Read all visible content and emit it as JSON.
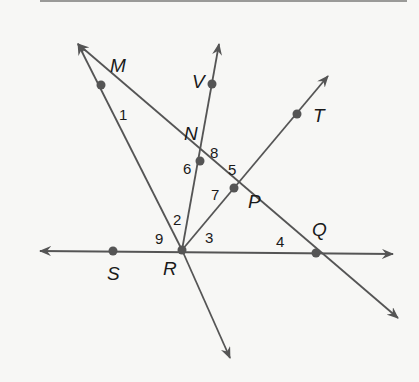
{
  "diagram": {
    "type": "geometry-lines-and-angles",
    "colors": {
      "line": "#555555",
      "point": "#555555",
      "text": "#1a1a1a",
      "background": "#f7f7f5"
    },
    "points": [
      {
        "name": "M",
        "x": 101,
        "y": 85,
        "lx": 110,
        "ly": 72
      },
      {
        "name": "V",
        "x": 212,
        "y": 84,
        "lx": 192,
        "ly": 88
      },
      {
        "name": "N",
        "x": 200,
        "y": 161,
        "lx": 184,
        "ly": 140
      },
      {
        "name": "P",
        "x": 234,
        "y": 188,
        "lx": 248,
        "ly": 208
      },
      {
        "name": "T",
        "x": 297,
        "y": 114,
        "lx": 313,
        "ly": 122
      },
      {
        "name": "R",
        "x": 182,
        "y": 250,
        "lx": 163,
        "ly": 275
      },
      {
        "name": "S",
        "x": 113,
        "y": 251,
        "lx": 107,
        "ly": 280
      },
      {
        "name": "Q",
        "x": 316,
        "y": 253,
        "lx": 312,
        "ly": 236
      }
    ],
    "angles": [
      {
        "label": "1",
        "x": 119,
        "y": 120
      },
      {
        "label": "2",
        "x": 173,
        "y": 225
      },
      {
        "label": "3",
        "x": 205,
        "y": 243
      },
      {
        "label": "4",
        "x": 276,
        "y": 247
      },
      {
        "label": "5",
        "x": 228,
        "y": 175
      },
      {
        "label": "6",
        "x": 183,
        "y": 174
      },
      {
        "label": "7",
        "x": 211,
        "y": 200
      },
      {
        "label": "8",
        "x": 210,
        "y": 158
      },
      {
        "label": "9",
        "x": 155,
        "y": 244
      }
    ],
    "lines": [
      {
        "name": "line-MQ",
        "x1": 78,
        "y1": 44,
        "x2": 398,
        "y2": 318,
        "arrow_start": true,
        "arrow_end": true
      },
      {
        "name": "ray-RM",
        "x1": 182,
        "y1": 250,
        "x2": 78,
        "y2": 44,
        "arrow_start": false,
        "arrow_end": true
      },
      {
        "name": "ray-R-down",
        "x1": 182,
        "y1": 250,
        "x2": 230,
        "y2": 358,
        "arrow_start": false,
        "arrow_end": true
      },
      {
        "name": "ray-RV",
        "x1": 182,
        "y1": 250,
        "x2": 219,
        "y2": 44,
        "arrow_start": false,
        "arrow_end": true
      },
      {
        "name": "ray-RT",
        "x1": 182,
        "y1": 250,
        "x2": 328,
        "y2": 76,
        "arrow_start": false,
        "arrow_end": true
      },
      {
        "name": "line-SQ",
        "x1": 40,
        "y1": 251,
        "x2": 393,
        "y2": 254,
        "arrow_start": true,
        "arrow_end": true
      }
    ]
  }
}
